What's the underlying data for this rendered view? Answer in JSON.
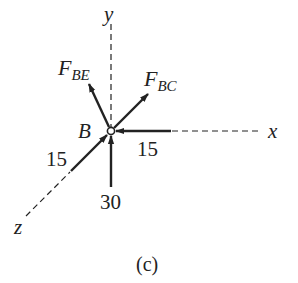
{
  "diagram": {
    "caption": "(c)",
    "point_label": "B",
    "axes": {
      "x": "x",
      "y": "y",
      "z": "z"
    },
    "forces": {
      "f_be": {
        "symbol": "F",
        "subscript": "BE"
      },
      "f_bc": {
        "symbol": "F",
        "subscript": "BC"
      },
      "along_x": {
        "value": "15"
      },
      "along_z": {
        "value": "15"
      },
      "along_y": {
        "value": "30"
      }
    },
    "colors": {
      "ink": "#222222",
      "background": "#ffffff"
    }
  }
}
